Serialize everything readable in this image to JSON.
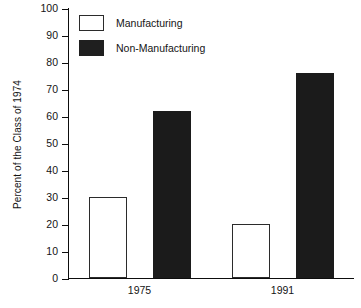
{
  "chart_data": {
    "type": "bar",
    "title": "",
    "xlabel": "",
    "ylabel": "Percent of the Class of 1974",
    "categories": [
      "1975",
      "1991"
    ],
    "series": [
      {
        "name": "Manufacturing",
        "values": [
          30,
          20
        ],
        "style": "open",
        "color": "#ffffff",
        "edge_color": "#2b2b2b"
      },
      {
        "name": "Non-Manufacturing",
        "values": [
          62,
          76
        ],
        "style": "filled",
        "color": "#1b1b1b",
        "edge_color": "#1b1b1b"
      }
    ],
    "ylim": [
      0,
      100
    ],
    "yticks": [
      0,
      10,
      20,
      30,
      40,
      50,
      60,
      70,
      80,
      90,
      100
    ],
    "ytick_labels": [
      "0",
      "10",
      "20",
      "30",
      "40",
      "50",
      "60",
      "70",
      "80",
      "90",
      "100"
    ],
    "grid": false,
    "legend_position": "upper-left-inside",
    "frame": "left-bottom-only"
  },
  "legend": {
    "entries": [
      {
        "label": "Manufacturing",
        "style": "open"
      },
      {
        "label": "Non-Manufacturing",
        "style": "filled"
      }
    ]
  }
}
